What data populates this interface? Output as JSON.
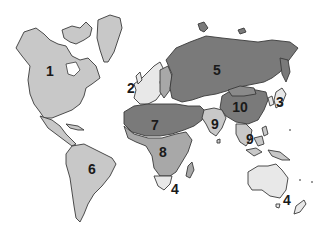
{
  "map": {
    "type": "world-regions",
    "style": "grayscale",
    "colors": {
      "background": "#ffffff",
      "border": "#3a3a3a",
      "light": "#c8c8c8",
      "medium": "#a8a8a8",
      "dark": "#7a7a7a",
      "very_light": "#e8e8e8",
      "label": "#1a1a1a"
    },
    "regions": [
      {
        "id": "1",
        "label": "1",
        "area": "North America",
        "shade": "light",
        "x": 50,
        "y": 71
      },
      {
        "id": "2",
        "label": "2",
        "area": "Western Europe",
        "shade": "very_light",
        "x": 131,
        "y": 88
      },
      {
        "id": "3",
        "label": "3",
        "area": "Japan / Korea",
        "shade": "very_light",
        "x": 280,
        "y": 102
      },
      {
        "id": "4a",
        "label": "4",
        "area": "South Africa",
        "shade": "very_light",
        "x": 175,
        "y": 189
      },
      {
        "id": "4b",
        "label": "4",
        "area": "Australia / New Zealand",
        "shade": "very_light",
        "x": 287,
        "y": 200
      },
      {
        "id": "5",
        "label": "5",
        "area": "Russia / Former USSR",
        "shade": "dark",
        "x": 217,
        "y": 70
      },
      {
        "id": "6",
        "label": "6",
        "area": "Latin America",
        "shade": "light",
        "x": 92,
        "y": 169
      },
      {
        "id": "7",
        "label": "7",
        "area": "North Africa / Middle East",
        "shade": "dark",
        "x": 155,
        "y": 125
      },
      {
        "id": "8",
        "label": "8",
        "area": "Sub-Saharan Africa",
        "shade": "medium",
        "x": 163,
        "y": 152
      },
      {
        "id": "9a",
        "label": "9",
        "area": "South Asia",
        "shade": "light",
        "x": 215,
        "y": 124
      },
      {
        "id": "9b",
        "label": "9",
        "area": "Southeast Asia",
        "shade": "light",
        "x": 250,
        "y": 139
      },
      {
        "id": "10",
        "label": "10",
        "area": "China",
        "shade": "dark",
        "x": 240,
        "y": 107
      }
    ]
  }
}
